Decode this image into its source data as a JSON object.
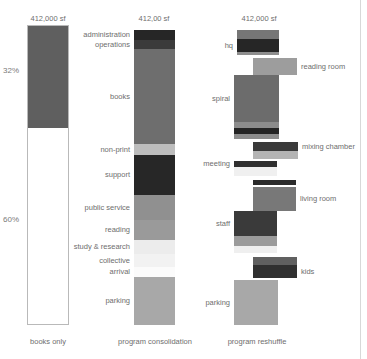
{
  "meta": {
    "background": "#ffffff",
    "text_color": "#6e6e6e",
    "rule_color": "#d8d8d8"
  },
  "columns": [
    {
      "id": "books-only",
      "total_label": "412,000 sf",
      "caption": "books only",
      "percent_top": "32%",
      "percent_bottom": "60%"
    },
    {
      "id": "program-consolidation",
      "total_label": "412,00 sf",
      "caption": "program consolidation"
    },
    {
      "id": "program-reshuffle",
      "total_label": "412,000 sf",
      "caption": "program reshuffle"
    }
  ],
  "chart_data": {
    "type": "bar",
    "title": "",
    "subtitle": "",
    "xlabel": "",
    "ylabel": "",
    "grid": false,
    "legend_position": "inline-labels",
    "orientation": "vertical-stacked",
    "axis_note": "bar height is proportional to program area; total of each column = 412,000 sf",
    "categories": [
      "books only",
      "program consolidation",
      "program reshuffle"
    ],
    "series": [
      {
        "name": "books only",
        "annotations": [
          "32%",
          "60%"
        ],
        "total": "412,000 sf",
        "segments": [
          {
            "label": "books",
            "color": "#5f5f5f",
            "top": 26,
            "height": 102,
            "left": 28,
            "width": 40,
            "label_side": "none"
          },
          {
            "label": "empty",
            "color": "#ffffff",
            "top": 128,
            "height": 196,
            "left": 28,
            "width": 40,
            "label_side": "none"
          }
        ]
      },
      {
        "name": "program consolidation",
        "total": "412,00 sf",
        "segments": [
          {
            "label": "administration",
            "color": "#262626",
            "top": 30,
            "height": 10,
            "left": 134,
            "width": 41,
            "label_side": "left"
          },
          {
            "label": "operations",
            "color": "#3b3b3b",
            "top": 40,
            "height": 9,
            "left": 134,
            "width": 41,
            "label_side": "left"
          },
          {
            "label": "books",
            "color": "#6e6e6e",
            "top": 49,
            "height": 95,
            "left": 134,
            "width": 41,
            "label_side": "left"
          },
          {
            "label": "non-print",
            "color": "#bdbdbd",
            "top": 144,
            "height": 11,
            "left": 134,
            "width": 41,
            "label_side": "left"
          },
          {
            "label": "support",
            "color": "#272727",
            "top": 155,
            "height": 40,
            "left": 134,
            "width": 41,
            "label_side": "left"
          },
          {
            "label": "public service",
            "color": "#909090",
            "top": 195,
            "height": 25,
            "left": 134,
            "width": 41,
            "label_side": "left"
          },
          {
            "label": "reading",
            "color": "#9a9a9a",
            "top": 220,
            "height": 20,
            "left": 134,
            "width": 41,
            "label_side": "left"
          },
          {
            "label": "study & research",
            "color": "#ececec",
            "top": 240,
            "height": 14,
            "left": 134,
            "width": 41,
            "label_side": "left"
          },
          {
            "label": "collective",
            "color": "#f2f2f2",
            "top": 254,
            "height": 13,
            "left": 134,
            "width": 41,
            "label_side": "left"
          },
          {
            "label": "arrival",
            "color": "#fbfbfb",
            "top": 267,
            "height": 10,
            "left": 134,
            "width": 41,
            "label_side": "left"
          },
          {
            "label": "parking",
            "color": "#a8a8a8",
            "top": 277,
            "height": 48,
            "left": 134,
            "width": 41,
            "label_side": "left"
          }
        ]
      },
      {
        "name": "program reshuffle",
        "total": "412,000 sf",
        "segments": [
          {
            "label": "hq",
            "color": "#767676",
            "top": 30,
            "height": 9,
            "left": 237,
            "width": 42,
            "label_side": "none"
          },
          {
            "label": "hq-dark",
            "color": "#262626",
            "top": 39,
            "height": 13,
            "left": 237,
            "width": 42,
            "label_side": "left",
            "label_text": "hq"
          },
          {
            "label": "hq-base",
            "color": "#8e8e8e",
            "top": 52,
            "height": 3,
            "left": 237,
            "width": 42,
            "label_side": "none"
          },
          {
            "label": "reading room",
            "color": "#9d9d9d",
            "top": 58,
            "height": 17,
            "left": 253,
            "width": 44,
            "label_side": "right"
          },
          {
            "label": "spiral",
            "color": "#6c6c6c",
            "top": 75,
            "height": 47,
            "left": 234,
            "width": 45,
            "label_side": "left"
          },
          {
            "label": "spiral-band",
            "color": "#8c8c8c",
            "top": 122,
            "height": 6,
            "left": 234,
            "width": 45,
            "label_side": "none"
          },
          {
            "label": "spiral-dark",
            "color": "#242424",
            "top": 128,
            "height": 6,
            "left": 234,
            "width": 45,
            "label_side": "none"
          },
          {
            "label": "spiral-foot",
            "color": "#8c8c8c",
            "top": 134,
            "height": 5,
            "left": 234,
            "width": 45,
            "label_side": "none"
          },
          {
            "label": "mixing chamber",
            "color": "#3a3a3a",
            "top": 142,
            "height": 9,
            "left": 253,
            "width": 45,
            "label_side": "right"
          },
          {
            "label": "mixing-base",
            "color": "#b4b4b4",
            "top": 151,
            "height": 8,
            "left": 253,
            "width": 45,
            "label_side": "none"
          },
          {
            "label": "meeting",
            "color": "#2f2f2f",
            "top": 161,
            "height": 6,
            "left": 234,
            "width": 43,
            "label_side": "left"
          },
          {
            "label": "meeting-base",
            "color": "#f0f0f0",
            "top": 167,
            "height": 9,
            "left": 234,
            "width": 43,
            "label_side": "none"
          },
          {
            "label": "living-top",
            "color": "#2b2b2b",
            "top": 180,
            "height": 5,
            "left": 253,
            "width": 43,
            "label_side": "none"
          },
          {
            "label": "living room",
            "color": "#787878",
            "top": 187,
            "height": 24,
            "left": 253,
            "width": 43,
            "label_side": "right"
          },
          {
            "label": "staff",
            "color": "#3a3a3a",
            "top": 211,
            "height": 25,
            "left": 234,
            "width": 43,
            "label_side": "left"
          },
          {
            "label": "staff-base",
            "color": "#9b9b9b",
            "top": 236,
            "height": 10,
            "left": 234,
            "width": 43,
            "label_side": "none"
          },
          {
            "label": "staff-foot",
            "color": "#efefef",
            "top": 246,
            "height": 7,
            "left": 234,
            "width": 43,
            "label_side": "none"
          },
          {
            "label": "kids-top",
            "color": "#606060",
            "top": 257,
            "height": 8,
            "left": 253,
            "width": 44,
            "label_side": "none"
          },
          {
            "label": "kids",
            "color": "#303030",
            "top": 265,
            "height": 13,
            "left": 253,
            "width": 44,
            "label_side": "right"
          },
          {
            "label": "parking",
            "color": "#a8a8a8",
            "top": 280,
            "height": 45,
            "left": 234,
            "width": 44,
            "label_side": "left"
          }
        ]
      }
    ]
  }
}
